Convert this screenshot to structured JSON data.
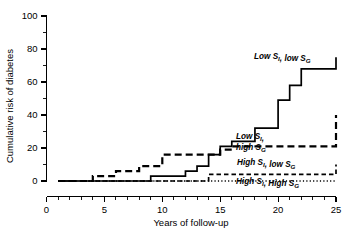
{
  "chart_data": {
    "type": "line",
    "title": "",
    "subtitle": "",
    "xlabel": "Years of follow-up",
    "ylabel": "Cumulative risk of diabetes",
    "xlim": [
      0,
      25
    ],
    "ylim": [
      0,
      100
    ],
    "x_ticks": [
      0,
      5,
      10,
      15,
      20,
      25
    ],
    "x_ticklabels": [
      "0",
      "5",
      "10",
      "15",
      "20",
      "25"
    ],
    "x_minor_tick_step": 1,
    "y_ticks": [
      0,
      20,
      40,
      60,
      80,
      100
    ],
    "y_ticklabels": [
      "0",
      "20",
      "40",
      "60",
      "80",
      "100"
    ],
    "y_minor_tick_step": 10,
    "grid": false,
    "legend_position": "inline-annotations",
    "step_interpolation": "post",
    "series": [
      {
        "name": "Low S_I, low S_G",
        "label_lines": [
          "Low S",
          "I",
          ", low S",
          "G"
        ],
        "linestyle": "solid",
        "color": "#000000",
        "x": [
          1,
          4,
          7,
          9,
          12,
          13,
          14,
          15,
          16,
          18,
          20,
          21,
          22,
          25
        ],
        "y": [
          0,
          0,
          0,
          3,
          6,
          9,
          16,
          21,
          24,
          32,
          49,
          58,
          68,
          75
        ]
      },
      {
        "name": "Low S_I, high S_G",
        "label_lines": [
          "Low S",
          "I",
          ",",
          "high S",
          "G"
        ],
        "linestyle": "long-dash",
        "color": "#000000",
        "x": [
          1,
          4,
          6,
          8,
          9,
          10,
          13,
          15,
          16,
          23,
          25
        ],
        "y": [
          0,
          3,
          6,
          9,
          9,
          16,
          16,
          19,
          21,
          21,
          40
        ]
      },
      {
        "name": "High S_I, low S_G",
        "label_lines": [
          "High S",
          "I",
          ", low S",
          "G"
        ],
        "linestyle": "short-dash",
        "color": "#000000",
        "x": [
          1,
          13,
          14,
          16,
          25
        ],
        "y": [
          0,
          0,
          4,
          4,
          10
        ]
      },
      {
        "name": "High S_I, High S_G",
        "label_lines": [
          "High S",
          "I",
          ", High S",
          "G"
        ],
        "linestyle": "dotted",
        "color": "#000000",
        "x": [
          1,
          16,
          25
        ],
        "y": [
          0,
          0,
          0
        ]
      }
    ],
    "annotations": [
      {
        "id": "label-low-si-low-sg",
        "text": "Low S_I, low S_G",
        "parts": [
          {
            "t": "Low S",
            "sub": false
          },
          {
            "t": "I",
            "sub": true
          },
          {
            "t": ", low S",
            "sub": false
          },
          {
            "t": "G",
            "sub": true
          }
        ],
        "x_px": 254,
        "y_px": 59
      },
      {
        "id": "label-low-si-high-sg-line1",
        "text": "Low S_I,",
        "parts": [
          {
            "t": "Low S",
            "sub": false
          },
          {
            "t": "I",
            "sub": true
          },
          {
            "t": ",",
            "sub": false
          }
        ],
        "x_px": 236,
        "y_px": 139
      },
      {
        "id": "label-low-si-high-sg-line2",
        "text": "high S_G",
        "parts": [
          {
            "t": "high S",
            "sub": false
          },
          {
            "t": "G",
            "sub": true
          }
        ],
        "x_px": 236,
        "y_px": 150
      },
      {
        "id": "label-high-si-low-sg",
        "text": "High S_I, low S_G",
        "parts": [
          {
            "t": "High S",
            "sub": false
          },
          {
            "t": "I",
            "sub": true
          },
          {
            "t": ", low S",
            "sub": false
          },
          {
            "t": "G",
            "sub": true
          }
        ],
        "x_px": 237,
        "y_px": 165
      },
      {
        "id": "label-high-si-high-sg",
        "text": "High S_I, High S_G",
        "parts": [
          {
            "t": "High S",
            "sub": false
          },
          {
            "t": "I",
            "sub": true
          },
          {
            "t": ", High S",
            "sub": false
          },
          {
            "t": "G",
            "sub": true
          }
        ],
        "x_px": 236,
        "y_px": 184
      }
    ]
  },
  "axes": {
    "xlabel": "Years of follow-up",
    "ylabel": "Cumulative risk of diabetes",
    "x_ticklabels": [
      "0",
      "5",
      "10",
      "15",
      "20",
      "25"
    ],
    "y_ticklabels": [
      "0",
      "20",
      "40",
      "60",
      "80",
      "100"
    ]
  }
}
